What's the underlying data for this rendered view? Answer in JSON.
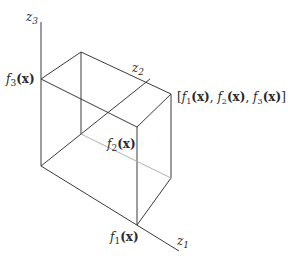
{
  "diagram": {
    "type": "objective-space-3d",
    "axes": [
      {
        "id": "z1",
        "label": "z",
        "subscript": "1"
      },
      {
        "id": "z2",
        "label": "z",
        "subscript": "2"
      },
      {
        "id": "z3",
        "label": "z",
        "subscript": "3"
      }
    ],
    "axis_point_labels": {
      "f1": {
        "fn": "f",
        "sub": "1",
        "arg": "(x)"
      },
      "f2": {
        "fn": "f",
        "sub": "2",
        "arg": "(x)"
      },
      "f3": {
        "fn": "f",
        "sub": "3",
        "arg": "(x)"
      }
    },
    "vector_label": {
      "open": "[",
      "parts": [
        {
          "fn": "f",
          "sub": "1",
          "arg": "(x)",
          "sep": ", "
        },
        {
          "fn": "f",
          "sub": "2",
          "arg": "(x)",
          "sep": ", "
        },
        {
          "fn": "f",
          "sub": "3",
          "arg": "(x)",
          "sep": ""
        }
      ],
      "close": "]"
    },
    "colors": {
      "line": "#3a3a3a",
      "hidden_line": "#b0b0b0",
      "text": "#2a2a2a"
    }
  }
}
